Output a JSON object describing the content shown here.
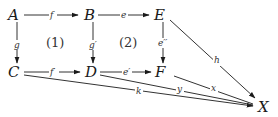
{
  "diagram": {
    "type": "commutative-diagram",
    "nodes": {
      "A": {
        "label": "A"
      },
      "B": {
        "label": "B"
      },
      "E": {
        "label": "E"
      },
      "C": {
        "label": "C"
      },
      "D": {
        "label": "D"
      },
      "F": {
        "label": "F"
      },
      "X": {
        "label": "X"
      }
    },
    "edges": {
      "f": {
        "from": "A",
        "to": "B",
        "label": "f"
      },
      "e": {
        "from": "B",
        "to": "E",
        "label": "e"
      },
      "g": {
        "from": "A",
        "to": "C",
        "label": "g"
      },
      "g_prime": {
        "from": "B",
        "to": "D",
        "label": "g′"
      },
      "e_dprime": {
        "from": "E",
        "to": "F",
        "label": "e′′"
      },
      "f_prime": {
        "from": "C",
        "to": "D",
        "label": "f′"
      },
      "e_prime": {
        "from": "D",
        "to": "F",
        "label": "e′"
      },
      "h": {
        "from": "E",
        "to": "X",
        "label": "h"
      },
      "k": {
        "from": "C",
        "to": "X",
        "label": "k"
      },
      "y": {
        "from": "D",
        "to": "X",
        "label": "y"
      },
      "x": {
        "from": "F",
        "to": "X",
        "label": "x"
      }
    },
    "regions": {
      "r1": {
        "label": "(1)"
      },
      "r2": {
        "label": "(2)"
      }
    }
  }
}
